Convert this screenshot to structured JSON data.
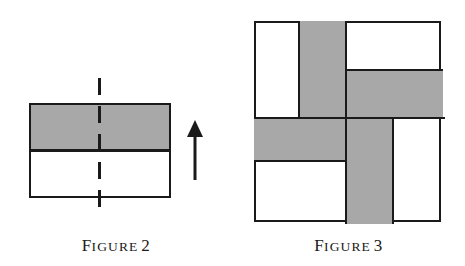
{
  "page": {
    "background_color": "#ffffff",
    "ink_color": "#1a1a1a",
    "fill_gray": "#a8a8a8",
    "width": 465,
    "height": 266
  },
  "figures": [
    {
      "id": "figure-2",
      "caption_lead": "F",
      "caption_rest": "IGURE",
      "caption_number": "2",
      "caption_full": "Figure 2",
      "description": "Rectangle split horizontally into a shaded upper band and a white lower band, with a vertical dashed mirror line through the centre and an upward arrow to the right.",
      "shapes": [
        {
          "name": "shaded-upper-band",
          "fill": "#a8a8a8",
          "x": 29,
          "y": 103,
          "w": 142,
          "h": 47
        },
        {
          "name": "white-lower-band",
          "fill": "#ffffff",
          "x": 29,
          "y": 150,
          "w": 142,
          "h": 48
        }
      ],
      "dashed_line": {
        "name": "mirror-axis",
        "x": 99,
        "y_top": 78,
        "y_bottom": 218
      },
      "arrow": {
        "name": "direction-arrow",
        "x": 195,
        "y_tip": 120,
        "y_tail": 180,
        "direction": "up"
      }
    },
    {
      "id": "figure-3",
      "caption_lead": "F",
      "caption_rest": "IGURE",
      "caption_number": "3",
      "caption_full": "Figure 3",
      "description": "Square divided into a pinwheel tiling of eight rectangles, four shaded gray and four white, arranged with rotational symmetry.",
      "square": {
        "x": 254,
        "y": 21,
        "w": 187,
        "h": 201
      },
      "tiles": [
        {
          "name": "tile-top-left-white",
          "fill": "#ffffff",
          "x": 254,
          "y": 21,
          "w": 44,
          "h": 94
        },
        {
          "name": "tile-top-center-gray",
          "fill": "#a8a8a8",
          "x": 298,
          "y": 21,
          "w": 47,
          "h": 94
        },
        {
          "name": "tile-top-right-white",
          "fill": "#ffffff",
          "x": 345,
          "y": 21,
          "w": 96,
          "h": 48
        },
        {
          "name": "tile-right-upper-gray",
          "fill": "#a8a8a8",
          "x": 345,
          "y": 69,
          "w": 96,
          "h": 46
        },
        {
          "name": "tile-left-middle-gray",
          "fill": "#a8a8a8",
          "x": 254,
          "y": 115,
          "w": 91,
          "h": 43
        },
        {
          "name": "tile-bottom-left-white",
          "fill": "#ffffff",
          "x": 254,
          "y": 158,
          "w": 91,
          "h": 64
        },
        {
          "name": "tile-bottom-center-gray",
          "fill": "#a8a8a8",
          "x": 345,
          "y": 115,
          "w": 47,
          "h": 107
        },
        {
          "name": "tile-bottom-right-white",
          "fill": "#ffffff",
          "x": 392,
          "y": 115,
          "w": 49,
          "h": 107
        }
      ],
      "grid_lines": {
        "vertical": [
          298,
          345,
          392
        ],
        "horizontal": [
          69,
          115,
          158
        ]
      }
    }
  ]
}
